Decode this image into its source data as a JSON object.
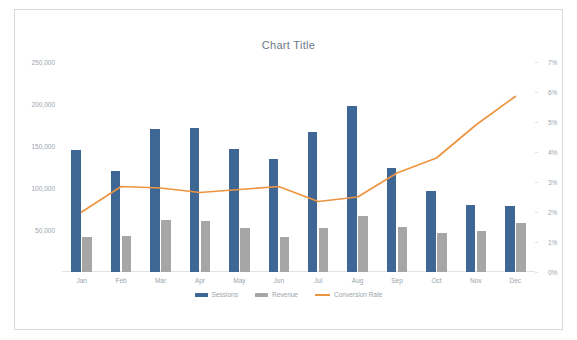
{
  "chart_data": {
    "type": "bar",
    "title": "Chart Title",
    "xlabel": "",
    "ylabel": "",
    "grid": false,
    "legend_position": "bottom",
    "categories": [
      "Jan",
      "Feb",
      "Mar",
      "Apr",
      "May",
      "Jun",
      "Jul",
      "Aug",
      "Sep",
      "Oct",
      "Nov",
      "Dec"
    ],
    "series": [
      {
        "name": "Sessions",
        "type": "bar",
        "axis": "left",
        "color": "#3f6795",
        "values": [
          145000,
          120000,
          170000,
          171000,
          147000,
          135000,
          167000,
          198000,
          124000,
          97000,
          80000,
          78000
        ]
      },
      {
        "name": "Revenue",
        "type": "bar",
        "axis": "left",
        "color": "#a6a6a6",
        "values": [
          42000,
          43000,
          62000,
          61000,
          52000,
          42000,
          52000,
          67000,
          53000,
          47000,
          49000,
          58000
        ]
      },
      {
        "name": "Conversion Rate",
        "type": "line",
        "axis": "right",
        "color": "#ed9440",
        "values": [
          2.0,
          2.85,
          2.8,
          2.65,
          2.75,
          2.85,
          2.35,
          2.5,
          3.3,
          3.8,
          4.9,
          5.85
        ]
      }
    ],
    "left_axis": {
      "min": 0,
      "max": 250000,
      "ticks": [
        50000,
        100000,
        150000,
        200000,
        250000
      ],
      "tick_labels": [
        "50,000",
        "100,000",
        "150,000",
        "200,000",
        "250,000"
      ]
    },
    "right_axis": {
      "min": 0,
      "max": 7,
      "ticks": [
        0,
        1,
        2,
        3,
        4,
        5,
        6,
        7
      ],
      "tick_labels": [
        "0%",
        "1%",
        "2%",
        "3%",
        "4%",
        "5%",
        "6%",
        "7%"
      ]
    }
  },
  "legend": [
    {
      "label": "Sessions"
    },
    {
      "label": "Revenue"
    },
    {
      "label": "Conversion Rate"
    }
  ]
}
